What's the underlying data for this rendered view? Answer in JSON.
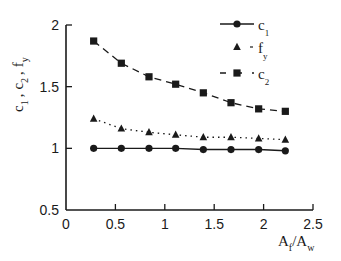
{
  "chart_data": {
    "type": "line",
    "title": "",
    "xlabel": "A_f/A_w",
    "ylabel": "c_1 , c_2 , f_y",
    "xlim": [
      0,
      2.5
    ],
    "ylim": [
      0.5,
      2
    ],
    "xticks": [
      0,
      0.5,
      1,
      1.5,
      2,
      2.5
    ],
    "xtick_labels": [
      "0",
      "0.5",
      "1",
      "1.5",
      "2",
      "2.5"
    ],
    "yticks": [
      0.5,
      1,
      1.5,
      2
    ],
    "ytick_labels": [
      "0.5",
      "1",
      "1.5",
      "2"
    ],
    "grid": false,
    "legend_position": "upper right",
    "x": [
      0.28,
      0.56,
      0.84,
      1.11,
      1.39,
      1.67,
      1.95,
      2.22
    ],
    "series": [
      {
        "name": "c1",
        "label_main": "c",
        "label_sub": "1",
        "marker": "circle",
        "line": "solid",
        "values": [
          1.0,
          1.0,
          1.0,
          1.0,
          0.99,
          0.99,
          0.99,
          0.98
        ]
      },
      {
        "name": "fy",
        "label_main": "f",
        "label_sub": "y",
        "marker": "triangle",
        "line": "dotted",
        "values": [
          1.24,
          1.16,
          1.13,
          1.11,
          1.09,
          1.09,
          1.08,
          1.07
        ]
      },
      {
        "name": "c2",
        "label_main": "c",
        "label_sub": "2",
        "marker": "square",
        "line": "dashed",
        "values": [
          1.87,
          1.69,
          1.58,
          1.52,
          1.45,
          1.37,
          1.32,
          1.3
        ]
      }
    ]
  },
  "axes": {
    "xlabel_main": "A",
    "xlabel_sub1": "f",
    "xlabel_slash": "/A",
    "xlabel_sub2": "w",
    "ylabel_parts": [
      "c",
      "1",
      ",",
      "c",
      "2",
      ",",
      "f",
      "y"
    ]
  },
  "colors": {
    "ink": "#1a1a1a",
    "background": "#ffffff"
  }
}
